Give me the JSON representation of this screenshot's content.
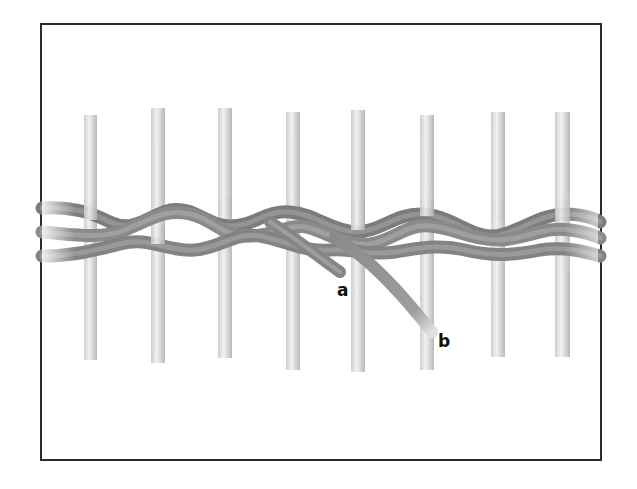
{
  "figure": {
    "stake_count": 8,
    "stake_x": [
      90,
      157,
      225,
      292,
      358,
      427,
      497,
      562
    ],
    "labels": [
      {
        "id": "a",
        "text": "a",
        "x": 337,
        "y": 284
      },
      {
        "id": "b",
        "text": "b",
        "x": 438,
        "y": 334
      }
    ],
    "colors": {
      "border": "#2a2a2a",
      "stake": "#e2e2e2",
      "stake_edge": "#a8a8a8",
      "weaver": "#8e8e8e",
      "weaver_light": "#b8b8b8",
      "weaver_dark": "#5e5e5e",
      "label": "#111111"
    }
  }
}
